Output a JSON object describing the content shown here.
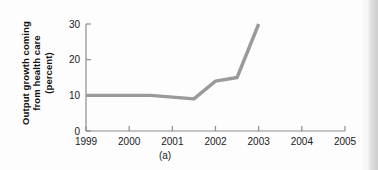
{
  "figure": {
    "caption": "(a)",
    "ylabel_lines": [
      "Output growth coming",
      "from health care",
      "(percent)"
    ],
    "line_color": "#9a9a9a",
    "axis_color": "#8c8c8c",
    "text_color": "#1a1a1a"
  },
  "chart_data": {
    "type": "line",
    "title": "",
    "xlabel": "",
    "ylabel": "Output growth coming from health care (percent)",
    "xlim": [
      1999,
      2005
    ],
    "ylim": [
      0,
      30
    ],
    "xticks": [
      1999,
      2000,
      2001,
      2002,
      2003,
      2004,
      2005
    ],
    "xtick_labels": [
      "1999",
      "2000",
      "2001",
      "2002",
      "2003",
      "2004",
      "2005"
    ],
    "yticks": [
      0,
      10,
      20,
      30
    ],
    "ytick_labels": [
      "0",
      "10",
      "20",
      "30"
    ],
    "grid": false,
    "legend": false,
    "series": [
      {
        "name": "Output growth coming from health care",
        "x": [
          1999,
          2000.5,
          2001.5,
          2002,
          2002.5,
          2003
        ],
        "values": [
          10,
          10,
          9,
          14,
          15,
          30
        ]
      }
    ]
  }
}
